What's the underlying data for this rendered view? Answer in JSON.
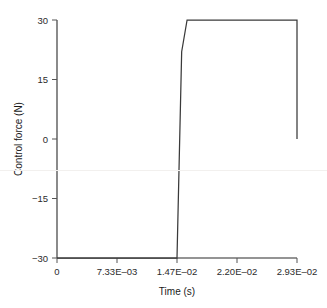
{
  "chart_data": {
    "type": "line",
    "title": "",
    "xlabel": "Time (s)",
    "ylabel": "Control force (N)",
    "xlim": [
      0,
      0.0293
    ],
    "ylim": [
      -30,
      30
    ],
    "grid": false,
    "legend": null,
    "xticks": [
      0,
      0.00733,
      0.0147,
      0.022,
      0.0293
    ],
    "xticklabels": [
      "0",
      "7.33E–03",
      "1.47E–02",
      "2.20E–02",
      "2.93E–02"
    ],
    "yticks": [
      -30,
      -15,
      0,
      15,
      30
    ],
    "yticklabels": [
      "−30",
      "−15",
      "0",
      "15",
      "30"
    ],
    "series": [
      {
        "name": "Control force",
        "color": "#3a3a3a",
        "x": [
          0.0,
          0.01465,
          0.01522,
          0.01588,
          0.0293,
          0.0293
        ],
        "y": [
          -30.0,
          -30.0,
          22.0,
          30.0,
          30.0,
          0.0
        ]
      }
    ],
    "annotations": []
  },
  "axis_style": {
    "spine_color": "#2b2b2b",
    "tick_color": "#555555",
    "line_color": "#3a3a3a",
    "background": "#ffffff"
  }
}
